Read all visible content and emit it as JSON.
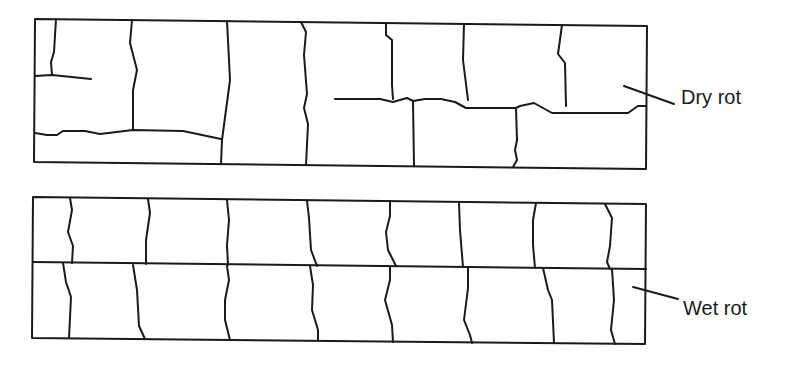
{
  "figure": {
    "type": "illustration",
    "panels": [
      {
        "id": "dry",
        "label": "Dry rot",
        "pattern": "cuboidal cracking, deep cross-grain cracks"
      },
      {
        "id": "wet",
        "label": "Wet rot",
        "pattern": "longitudinal cracking with fewer cross cracks"
      }
    ]
  },
  "labels": {
    "dry_rot": "Dry rot",
    "wet_rot": "Wet rot"
  },
  "colors": {
    "line": "#1a1a1a",
    "background": "#ffffff"
  }
}
